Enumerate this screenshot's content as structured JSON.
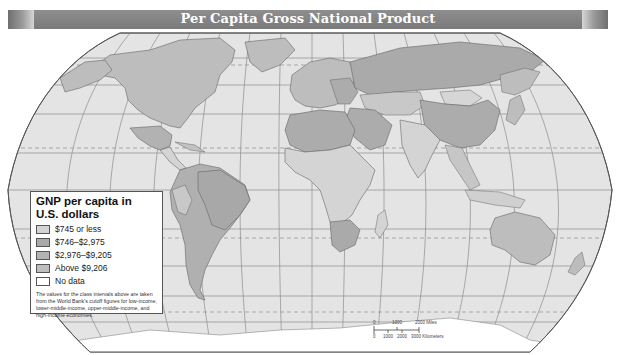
{
  "title": "Per Capita Gross National Product",
  "colors": {
    "banner": "#808080",
    "ocean": "#e4e4e4",
    "graticule": "#8a8a8a",
    "class_745_or_less": "#d4d4d4",
    "class_746_2975": "#b4b4b4",
    "class_2976_9205": "#a6a6a6",
    "class_above_9206": "#bdbdbd",
    "no_data": "#ffffff"
  },
  "legend": {
    "title_line1": "GNP per capita in",
    "title_line2": "U.S. dollars",
    "items": [
      {
        "label": "$745 or less",
        "color": "#d4d4d4"
      },
      {
        "label": "$746–$2,975",
        "color": "#a9a9a9"
      },
      {
        "label": "$2,976–$9,205",
        "color": "#b3b3b3"
      },
      {
        "label": "Above $9,206",
        "color": "#bebebe"
      },
      {
        "label": "No data",
        "color": "#ffffff"
      }
    ],
    "note": "The values for the class intervals above are taken from the World Bank's cutoff figures for low-income, lower-middle-income, upper-middle-income, and high-income economies."
  },
  "scale_bar": {
    "miles_labels": [
      "0",
      "1000",
      "2000 Miles"
    ],
    "km_labels": [
      "0",
      "1000",
      "2000",
      "3000 Kilometers"
    ]
  }
}
